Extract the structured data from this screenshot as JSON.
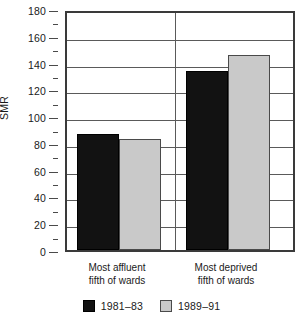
{
  "chart_data": {
    "type": "bar",
    "title": "",
    "xlabel": "",
    "ylabel": "SMR",
    "ylim": [
      0,
      180
    ],
    "ytick_step": 20,
    "yminor_step": 10,
    "grid": "horizontal major gridlines only",
    "legend_position": "bottom-center",
    "categories": [
      "Most affluent\nfifth of wards",
      "Most deprived\nfifth of wards"
    ],
    "category_lines": [
      [
        "Most affluent",
        "fifth of wards"
      ],
      [
        "Most deprived",
        "fifth of wards"
      ]
    ],
    "series": [
      {
        "name": "1981–83",
        "color": "#121212",
        "values": [
          87,
          134
        ]
      },
      {
        "name": "1989–91",
        "color": "#c9c9c9",
        "values": [
          83,
          146
        ]
      }
    ],
    "ytick_labels": [
      "0",
      "20",
      "40",
      "60",
      "80",
      "100",
      "120",
      "140",
      "160",
      "180"
    ],
    "ytick_values": [
      0,
      20,
      40,
      60,
      80,
      100,
      120,
      140,
      160,
      180
    ]
  }
}
